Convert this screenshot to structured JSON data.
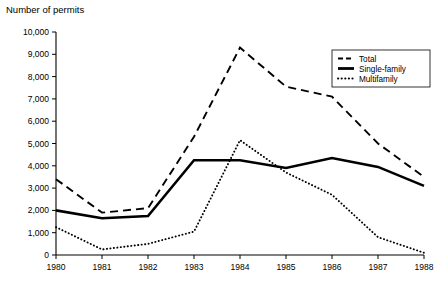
{
  "chart_data": {
    "type": "line",
    "title": "Number of permits",
    "xlabel": "",
    "ylabel": "Number of permits",
    "x": [
      1980,
      1981,
      1982,
      1983,
      1984,
      1985,
      1986,
      1987,
      1988
    ],
    "xtick_labels": [
      "1980",
      "1981",
      "1982",
      "1983",
      "1984",
      "1985",
      "1986",
      "1987",
      "1988"
    ],
    "ytick_labels": [
      "0",
      "1,000",
      "2,000",
      "3,000",
      "4,000",
      "5,000",
      "6,000",
      "7,000",
      "8,000",
      "9,000",
      "10,000"
    ],
    "ytick_values": [
      0,
      1000,
      2000,
      3000,
      4000,
      5000,
      6000,
      7000,
      8000,
      9000,
      10000
    ],
    "ylim": [
      0,
      10000
    ],
    "xlim": [
      1980,
      1988
    ],
    "grid": false,
    "legend_position": "upper right",
    "series": [
      {
        "name": "Total",
        "style": "dashed",
        "values": [
          3400,
          1900,
          2100,
          5300,
          9300,
          7550,
          7100,
          5000,
          3500
        ]
      },
      {
        "name": "Single-family",
        "style": "solid",
        "values": [
          2000,
          1650,
          1750,
          4250,
          4250,
          3900,
          4350,
          3950,
          3100
        ]
      },
      {
        "name": "Multifamily",
        "style": "dotted",
        "values": [
          1250,
          250,
          500,
          1050,
          5150,
          3700,
          2700,
          800,
          100
        ]
      }
    ]
  },
  "legend": {
    "items": [
      {
        "label": "Total"
      },
      {
        "label": "Single-family"
      },
      {
        "label": "Multifamily"
      }
    ]
  }
}
